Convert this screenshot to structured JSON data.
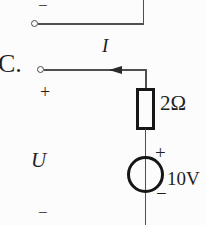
{
  "colors": {
    "background": "#fcfcfc",
    "wire": "#4f4f4f",
    "component_stroke": "#161616",
    "text": "#1f1f1f"
  },
  "circuit": {
    "option_label": "C.",
    "current_label": "I",
    "port_voltage_label": "U",
    "top_branch_polarity": "−",
    "port_plus": "+",
    "port_minus": "−",
    "resistor": {
      "value": "2Ω"
    },
    "source": {
      "value": "10V",
      "plus": "+",
      "minus": "−"
    }
  }
}
